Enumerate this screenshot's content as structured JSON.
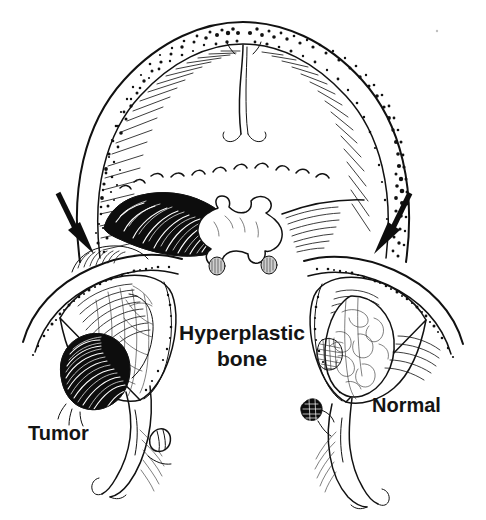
{
  "figure": {
    "kind": "anatomical-line-drawing",
    "background_color": "#ffffff",
    "ink_color": "#111111",
    "canvas": {
      "width": 486,
      "height": 520
    }
  },
  "labels": {
    "center": {
      "line1": "Hyperplastic",
      "line2": "bone",
      "x": 242,
      "y": 338,
      "font_weight": "bold",
      "font_size_px": 21,
      "align": "center"
    },
    "left": {
      "text": "Tumor",
      "x": 28,
      "y": 440,
      "font_weight": "bold",
      "font_size_px": 20,
      "align": "left"
    },
    "right": {
      "text": "Normal",
      "x": 372,
      "y": 412,
      "font_weight": "bold",
      "font_size_px": 20,
      "align": "left"
    }
  },
  "annotations": {
    "arrows": [
      {
        "name": "left-arrow",
        "points_to": "hyperplastic bone / thickened left skull wall",
        "from_x": 58,
        "from_y": 193,
        "to_x": 85,
        "to_y": 249,
        "direction": "down-right"
      },
      {
        "name": "right-arrow",
        "points_to": "normal right skull wall",
        "from_x": 410,
        "from_y": 193,
        "to_x": 382,
        "to_y": 249,
        "direction": "down-left"
      }
    ]
  },
  "structures": [
    {
      "name": "cranial-vault",
      "description": "Arched double-contour skull vault with stippled diploe"
    },
    {
      "name": "diploe-stipple-left",
      "description": "Fine stippled marrow space, left vault"
    },
    {
      "name": "diploe-stipple-right",
      "description": "Dense stippled marrow space, right vault"
    },
    {
      "name": "inner-table-hatching",
      "description": "Radiating hatch lines on inner table of vault"
    },
    {
      "name": "metopic-suture",
      "description": "Midline vertical suture line at vault apex"
    },
    {
      "name": "cribriform-dashed-line",
      "description": "Wavy dashed line across the anterior cranial floor"
    },
    {
      "name": "hyperplastic-bone-mass",
      "description": "Large solid black elongated mass on left orbital roof"
    },
    {
      "name": "sphenoid-body",
      "description": "Central butterfly-shaped sphenoid / sella region"
    },
    {
      "name": "sphenoid-nodule-left",
      "description": "Small shaded nodule at left base of sphenoid"
    },
    {
      "name": "sphenoid-nodule-right",
      "description": "Small shaded nodule at right base of sphenoid"
    },
    {
      "name": "left-orbit",
      "description": "Cut-away left orbit with contents displaced by tumor"
    },
    {
      "name": "tumor-mass",
      "description": "Rounded solid black tumor in inferolateral left orbit"
    },
    {
      "name": "left-globe",
      "description": "Left globe and intraorbital soft tissue with vessels"
    },
    {
      "name": "left-optic-nerve",
      "description": "Left optic nerve descending from globe"
    },
    {
      "name": "right-orbit",
      "description": "Cut-away normal right orbit"
    },
    {
      "name": "right-globe",
      "description": "Right globe with fine vascular markings"
    },
    {
      "name": "right-optic-nerve",
      "description": "Right optic nerve descending from globe"
    },
    {
      "name": "right-small-nodule",
      "description": "Small dark nodule lateral to right optic nerve"
    }
  ]
}
